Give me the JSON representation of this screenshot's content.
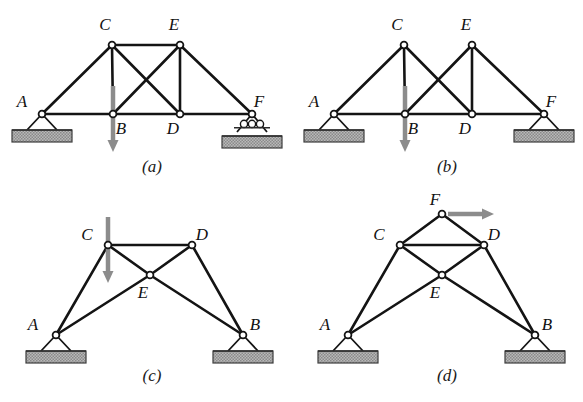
{
  "figure": {
    "background_color": "#ffffff",
    "member_color": "#141414",
    "load_color": "#8c8c8c",
    "ground_color": "#a8a8a8"
  },
  "panels": [
    {
      "id": "a",
      "caption": "(a)",
      "caption_x": 152,
      "caption_y": 172,
      "nodes": [
        {
          "name": "A",
          "x": 42,
          "y": 114,
          "label_x": 22,
          "label_y": 107
        },
        {
          "name": "C",
          "x": 112,
          "y": 45,
          "label_x": 105,
          "label_y": 30
        },
        {
          "name": "E",
          "x": 180,
          "y": 45,
          "label_x": 174,
          "label_y": 30
        },
        {
          "name": "B",
          "x": 113,
          "y": 114,
          "label_x": 121,
          "label_y": 134
        },
        {
          "name": "D",
          "x": 180,
          "y": 114,
          "label_x": 173,
          "label_y": 134
        },
        {
          "name": "F",
          "x": 252,
          "y": 114,
          "label_x": 259,
          "label_y": 107
        }
      ],
      "members": [
        [
          "A",
          "C"
        ],
        [
          "C",
          "E"
        ],
        [
          "E",
          "F"
        ],
        [
          "A",
          "B"
        ],
        [
          "B",
          "D"
        ],
        [
          "D",
          "F"
        ],
        [
          "C",
          "B"
        ],
        [
          "E",
          "D"
        ],
        [
          "C",
          "D"
        ],
        [
          "B",
          "E"
        ]
      ],
      "supports": [
        {
          "type": "pin",
          "node": "A"
        },
        {
          "type": "roller",
          "node": "F"
        }
      ],
      "loads": [
        {
          "at": "B",
          "direction": "down",
          "length": 38,
          "label": ""
        }
      ]
    },
    {
      "id": "b",
      "caption": "(b)",
      "caption_x": 447,
      "caption_y": 172,
      "nodes": [
        {
          "name": "A",
          "x": 334,
          "y": 114,
          "label_x": 314,
          "label_y": 107
        },
        {
          "name": "C",
          "x": 404,
          "y": 45,
          "label_x": 397,
          "label_y": 30
        },
        {
          "name": "E",
          "x": 472,
          "y": 45,
          "label_x": 466,
          "label_y": 30
        },
        {
          "name": "B",
          "x": 405,
          "y": 114,
          "label_x": 413,
          "label_y": 134
        },
        {
          "name": "D",
          "x": 472,
          "y": 114,
          "label_x": 465,
          "label_y": 134
        },
        {
          "name": "F",
          "x": 544,
          "y": 114,
          "label_x": 551,
          "label_y": 107
        }
      ],
      "members": [
        [
          "A",
          "C"
        ],
        [
          "E",
          "F"
        ],
        [
          "A",
          "B"
        ],
        [
          "B",
          "D"
        ],
        [
          "D",
          "F"
        ],
        [
          "C",
          "B"
        ],
        [
          "E",
          "D"
        ],
        [
          "C",
          "D"
        ],
        [
          "B",
          "E"
        ]
      ],
      "supports": [
        {
          "type": "pin",
          "node": "A"
        },
        {
          "type": "pin",
          "node": "F"
        }
      ],
      "loads": [
        {
          "at": "B",
          "direction": "down",
          "length": 38,
          "label": ""
        }
      ]
    },
    {
      "id": "c",
      "caption": "(c)",
      "caption_x": 152,
      "caption_y": 381,
      "nodes": [
        {
          "name": "A",
          "x": 56,
          "y": 335,
          "label_x": 33,
          "label_y": 330
        },
        {
          "name": "B",
          "x": 243,
          "y": 335,
          "label_x": 255,
          "label_y": 330
        },
        {
          "name": "C",
          "x": 108,
          "y": 245,
          "label_x": 87,
          "label_y": 240
        },
        {
          "name": "D",
          "x": 192,
          "y": 245,
          "label_x": 202,
          "label_y": 240
        },
        {
          "name": "E",
          "x": 150,
          "y": 275,
          "label_x": 143,
          "label_y": 298
        }
      ],
      "members": [
        [
          "A",
          "C"
        ],
        [
          "C",
          "D"
        ],
        [
          "D",
          "B"
        ],
        [
          "A",
          "E"
        ],
        [
          "E",
          "D"
        ],
        [
          "C",
          "E"
        ],
        [
          "E",
          "B"
        ]
      ],
      "supports": [
        {
          "type": "pin",
          "node": "A"
        },
        {
          "type": "pin",
          "node": "B"
        }
      ],
      "loads": [
        {
          "at": "C",
          "direction": "down",
          "length": 38,
          "label": ""
        }
      ]
    },
    {
      "id": "d",
      "caption": "(d)",
      "caption_x": 447,
      "caption_y": 381,
      "nodes": [
        {
          "name": "A",
          "x": 348,
          "y": 335,
          "label_x": 325,
          "label_y": 330
        },
        {
          "name": "B",
          "x": 535,
          "y": 335,
          "label_x": 547,
          "label_y": 330
        },
        {
          "name": "C",
          "x": 400,
          "y": 245,
          "label_x": 379,
          "label_y": 240
        },
        {
          "name": "D",
          "x": 484,
          "y": 245,
          "label_x": 494,
          "label_y": 240
        },
        {
          "name": "E",
          "x": 442,
          "y": 275,
          "label_x": 435,
          "label_y": 298
        },
        {
          "name": "F",
          "x": 442,
          "y": 214,
          "label_x": 435,
          "label_y": 205
        }
      ],
      "members": [
        [
          "A",
          "C"
        ],
        [
          "C",
          "D"
        ],
        [
          "D",
          "B"
        ],
        [
          "A",
          "E"
        ],
        [
          "E",
          "D"
        ],
        [
          "C",
          "E"
        ],
        [
          "E",
          "B"
        ],
        [
          "C",
          "F"
        ],
        [
          "F",
          "D"
        ]
      ],
      "supports": [
        {
          "type": "pin",
          "node": "A"
        },
        {
          "type": "pin",
          "node": "B"
        }
      ],
      "loads": [
        {
          "at": "F",
          "direction": "right",
          "length": 52,
          "label": ""
        }
      ]
    }
  ]
}
